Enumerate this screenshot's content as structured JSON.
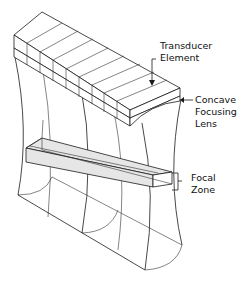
{
  "figure": {
    "type": "diagram",
    "labels": {
      "transducer_element": [
        "Transducer",
        "Element"
      ],
      "concave_lens": [
        "Concave",
        "Focusing",
        "Lens"
      ],
      "focal_zone": [
        "Focal",
        "Zone"
      ]
    },
    "element_count": 9,
    "colors": {
      "line": "#1a1a1a",
      "focal_zone_fill": "#e6e6e6",
      "background": "#ffffff"
    }
  }
}
